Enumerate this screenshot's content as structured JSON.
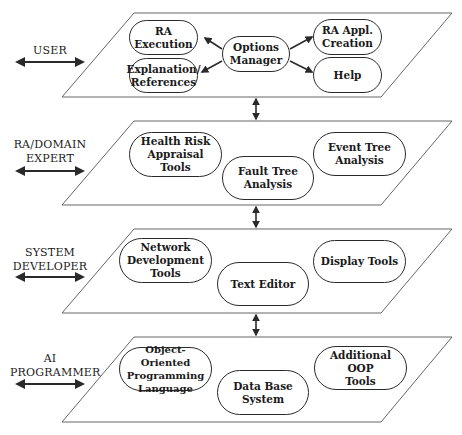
{
  "diagram": {
    "colors": {
      "line": "#2a2a2a",
      "background": "#ffffff",
      "text": "#1a1a1a"
    },
    "layers": [
      {
        "role": "USER",
        "nodes": [
          {
            "id": "ra-execution",
            "label": "RA Execution"
          },
          {
            "id": "explanation-references",
            "label": "Explanation/\nReferences"
          },
          {
            "id": "options-manager",
            "label": "Options\nManager"
          },
          {
            "id": "ra-appl-creation",
            "label": "RA Appl.\nCreation"
          },
          {
            "id": "help",
            "label": "Help"
          }
        ]
      },
      {
        "role": "RA/DOMAIN\nEXPERT",
        "nodes": [
          {
            "id": "health-risk-appraisal-tools",
            "label": "Health Risk\nAppraisal\nTools"
          },
          {
            "id": "fault-tree-analysis",
            "label": "Fault Tree\nAnalysis"
          },
          {
            "id": "event-tree-analysis",
            "label": "Event Tree\nAnalysis"
          }
        ]
      },
      {
        "role": "SYSTEM\nDEVELOPER",
        "nodes": [
          {
            "id": "network-development-tools",
            "label": "Network\nDevelopment\nTools"
          },
          {
            "id": "text-editor",
            "label": "Text Editor"
          },
          {
            "id": "display-tools",
            "label": "Display Tools"
          }
        ]
      },
      {
        "role": "AI\nPROGRAMMER",
        "nodes": [
          {
            "id": "object-oriented-programming-language",
            "label": "Object-Oriented\nProgramming\nLanguage"
          },
          {
            "id": "data-base-system",
            "label": "Data Base\nSystem"
          },
          {
            "id": "additional-oop-tools",
            "label": "Additional\nOOP\nTools"
          }
        ]
      }
    ],
    "edges": [
      {
        "from": "options-manager",
        "to": "ra-execution",
        "type": "arrow"
      },
      {
        "from": "options-manager",
        "to": "explanation-references",
        "type": "arrow"
      },
      {
        "from": "options-manager",
        "to": "ra-appl-creation",
        "type": "arrow"
      },
      {
        "from": "options-manager",
        "to": "help",
        "type": "arrow"
      },
      {
        "from": "layer-1",
        "to": "layer-2",
        "type": "bidirectional"
      },
      {
        "from": "layer-2",
        "to": "layer-3",
        "type": "bidirectional"
      },
      {
        "from": "layer-3",
        "to": "layer-4",
        "type": "bidirectional"
      }
    ]
  }
}
